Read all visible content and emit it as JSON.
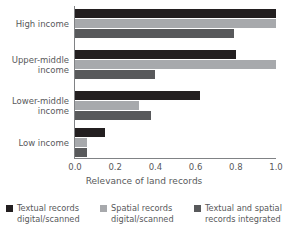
{
  "chart_data": {
    "type": "bar",
    "orientation": "horizontal",
    "title": "",
    "xlabel": "Relevance of land records",
    "ylabel": "",
    "xlim": [
      0.0,
      1.0
    ],
    "xticks": [
      "0.0",
      "0.2",
      "0.4",
      "0.6",
      "0.8",
      "1.0"
    ],
    "xtick_values": [
      0.0,
      0.2,
      0.4,
      0.6,
      0.8,
      1.0
    ],
    "grid": false,
    "legend_position": "bottom",
    "categories": [
      "High income",
      "Upper-middle\nincome",
      "Lower-middle\nincome",
      "Low income"
    ],
    "series": [
      {
        "name": "Textual records\ndigital/scanned",
        "color": "#231f20",
        "values": [
          1.0,
          0.8,
          0.62,
          0.15
        ]
      },
      {
        "name": "Spatial records\ndigital/scanned",
        "color": "#a7a9ac",
        "values": [
          1.0,
          1.0,
          0.32,
          0.06
        ]
      },
      {
        "name": "Textual and spatial\nrecords integrated",
        "color": "#58595b",
        "values": [
          0.79,
          0.4,
          0.38,
          0.06
        ]
      }
    ]
  },
  "legend": {
    "items": [
      {
        "label": "Textual records\ndigital/scanned",
        "color": "#231f20"
      },
      {
        "label": "Spatial records\ndigital/scanned",
        "color": "#a7a9ac"
      },
      {
        "label": "Textual and spatial\nrecords integrated",
        "color": "#58595b"
      }
    ]
  },
  "axis": {
    "x_title": "Relevance of land records"
  }
}
